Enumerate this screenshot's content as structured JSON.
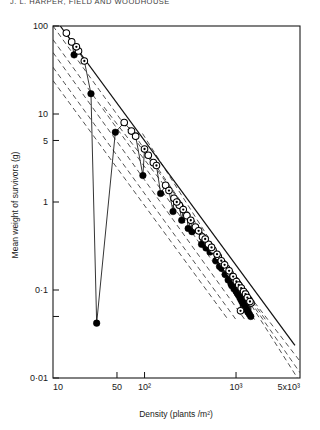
{
  "running_head": "J. L. HARPER, FIELD AND WOODHOUSE",
  "chart_data": {
    "type": "scatter",
    "title": "",
    "xlabel": "Density (plants /m²)",
    "ylabel": "Mean weight of survivors (g)",
    "xscale": "log",
    "yscale": "log",
    "xlim": [
      10,
      5000
    ],
    "ylim": [
      0.01,
      100
    ],
    "grid": false,
    "legend_position": "none",
    "x_ticks": [
      {
        "value": 10,
        "label": "10"
      },
      {
        "value": 50,
        "label": "50"
      },
      {
        "value": 100,
        "label": "10²"
      },
      {
        "value": 1000,
        "label": "10³"
      },
      {
        "value": 5000,
        "label": "5x10³"
      }
    ],
    "y_ticks": [
      {
        "value": 100,
        "label": "100"
      },
      {
        "value": 10,
        "label": "10"
      },
      {
        "value": 5,
        "label": "5"
      },
      {
        "value": 1,
        "label": "1"
      },
      {
        "value": 0.1,
        "label": "0·1"
      },
      {
        "value": 0.05,
        "label": ""
      },
      {
        "value": 0.01,
        "label": "0·01"
      }
    ],
    "series": [
      {
        "name": "filled-circles",
        "marker": "filled-circle",
        "points": [
          [
            17,
            47
          ],
          [
            26,
            17
          ],
          [
            48,
            6.2
          ],
          [
            96,
            2.0
          ],
          [
            150,
            1.25
          ],
          [
            205,
            0.78
          ],
          [
            255,
            0.62
          ],
          [
            300,
            0.5
          ],
          [
            330,
            0.46
          ],
          [
            420,
            0.33
          ],
          [
            470,
            0.3
          ],
          [
            520,
            0.27
          ],
          [
            600,
            0.215
          ],
          [
            660,
            0.185
          ],
          [
            700,
            0.175
          ],
          [
            760,
            0.15
          ],
          [
            820,
            0.13
          ],
          [
            880,
            0.118
          ],
          [
            900,
            0.112
          ],
          [
            950,
            0.103
          ],
          [
            1000,
            0.097
          ],
          [
            1030,
            0.092
          ],
          [
            1060,
            0.088
          ],
          [
            1100,
            0.082
          ],
          [
            1130,
            0.078
          ],
          [
            1160,
            0.074
          ],
          [
            1200,
            0.07
          ],
          [
            1250,
            0.064
          ],
          [
            1300,
            0.06
          ],
          [
            1350,
            0.056
          ],
          [
            1400,
            0.053
          ],
          [
            1450,
            0.05
          ],
          [
            30,
            0.042
          ]
        ]
      },
      {
        "name": "open-circles",
        "marker": "open-circle",
        "points": [
          [
            14,
            83
          ],
          [
            16,
            66
          ],
          [
            19,
            52
          ],
          [
            60,
            8.0
          ],
          [
            72,
            6.4
          ],
          [
            80,
            5.6
          ],
          [
            110,
            3.4
          ],
          [
            125,
            2.8
          ],
          [
            170,
            1.55
          ],
          [
            210,
            1.1
          ],
          [
            240,
            0.92
          ],
          [
            290,
            0.7
          ],
          [
            360,
            0.52
          ],
          [
            430,
            0.4
          ],
          [
            500,
            0.33
          ],
          [
            560,
            0.285
          ],
          [
            640,
            0.24
          ],
          [
            720,
            0.2
          ],
          [
            790,
            0.175
          ],
          [
            860,
            0.155
          ],
          [
            920,
            0.14
          ],
          [
            980,
            0.128
          ],
          [
            1040,
            0.118
          ],
          [
            1090,
            0.11
          ],
          [
            1150,
            0.102
          ],
          [
            1220,
            0.094
          ],
          [
            1290,
            0.086
          ],
          [
            1380,
            0.078
          ],
          [
            1460,
            0.071
          ]
        ]
      },
      {
        "name": "dotted-circles",
        "marker": "dotted-circle",
        "points": [
          [
            18,
            58
          ],
          [
            22,
            40
          ],
          [
            100,
            4.0
          ],
          [
            135,
            2.6
          ],
          [
            185,
            1.35
          ],
          [
            225,
            1.0
          ],
          [
            265,
            0.82
          ],
          [
            320,
            0.62
          ],
          [
            390,
            0.47
          ],
          [
            460,
            0.38
          ],
          [
            540,
            0.305
          ],
          [
            620,
            0.255
          ],
          [
            690,
            0.215
          ],
          [
            750,
            0.193
          ],
          [
            840,
            0.165
          ],
          [
            930,
            0.142
          ],
          [
            1010,
            0.125
          ],
          [
            1070,
            0.114
          ],
          [
            1140,
            0.105
          ],
          [
            1210,
            0.096
          ],
          [
            1270,
            0.09
          ],
          [
            1330,
            0.082
          ],
          [
            1420,
            0.074
          ],
          [
            1120,
            0.058
          ]
        ]
      }
    ],
    "fit_line": {
      "name": "fitted-regression-line",
      "style": "solid",
      "x1": 12,
      "y1": 100,
      "x2": 4400,
      "y2": 0.0235
    },
    "band_lines": [
      {
        "name": "upper-band-1",
        "style": "dashed",
        "x1": 10,
        "y1": 100,
        "x2": 2100,
        "y2": 0.046
      },
      {
        "name": "upper-band-2",
        "style": "dashed",
        "x1": 10,
        "y1": 70,
        "x2": 1600,
        "y2": 0.046
      },
      {
        "name": "upper-band-3",
        "style": "dashed",
        "x1": 10,
        "y1": 50,
        "x2": 1250,
        "y2": 0.046
      },
      {
        "name": "lower-band-1",
        "style": "dashed",
        "x1": 10,
        "y1": 34,
        "x2": 1000,
        "y2": 0.046
      },
      {
        "name": "lower-band-2",
        "style": "dashed",
        "x1": 10,
        "y1": 24,
        "x2": 820,
        "y2": 0.046
      },
      {
        "name": "mid-band-1",
        "style": "dashed",
        "x1": 36,
        "y1": 12.0,
        "x2": 5000,
        "y2": 0.0155
      },
      {
        "name": "mid-band-2",
        "style": "dashed",
        "x1": 60,
        "y1": 8.5,
        "x2": 5000,
        "y2": 0.0115
      },
      {
        "name": "mid-band-3",
        "style": "dashed",
        "x1": 95,
        "y1": 6.0,
        "x2": 5000,
        "y2": 0.009
      }
    ]
  }
}
